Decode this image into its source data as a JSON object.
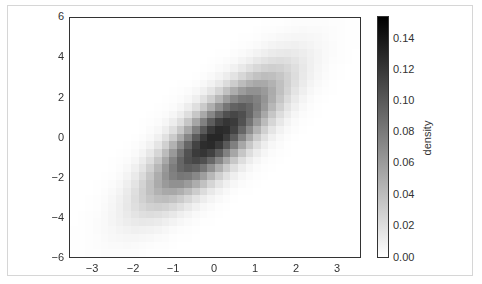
{
  "chart_data": {
    "type": "heatmap",
    "title": "",
    "xlabel": "",
    "ylabel": "",
    "xlim": [
      -3.5,
      3.5
    ],
    "ylim": [
      -6,
      6
    ],
    "x_ticks": [
      -3,
      -2,
      -1,
      0,
      1,
      2,
      3
    ],
    "y_ticks": [
      6,
      4,
      2,
      0,
      -2,
      -4,
      -6
    ],
    "x_tick_labels": [
      "−3",
      "−2",
      "−1",
      "0",
      "1",
      "2",
      "3"
    ],
    "y_tick_labels": [
      "6",
      "4",
      "2",
      "0",
      "−2",
      "−4",
      "−6"
    ],
    "grid": false,
    "colormap": "Greys",
    "distribution": {
      "kind": "bivariate-gaussian",
      "mean": [
        0,
        0
      ],
      "sigma_x": 1.0,
      "sigma_y": 2.0,
      "rho": 0.8,
      "bins_x": 38,
      "bins_y": 31
    },
    "colorbar": {
      "label": "density",
      "vmin": 0.0,
      "vmax": 0.155,
      "ticks": [
        0.14,
        0.12,
        0.1,
        0.08,
        0.06,
        0.04,
        0.02,
        0.0
      ],
      "tick_labels": [
        "0.14",
        "0.12",
        "0.10",
        "0.08",
        "0.06",
        "0.04",
        "0.02",
        "0.00"
      ]
    },
    "sampled_density": {
      "note": "approximate density at selected points read from shading",
      "points": [
        {
          "x": 0,
          "y": 0,
          "density": 0.13
        },
        {
          "x": -1,
          "y": -1.5,
          "density": 0.08
        },
        {
          "x": 1,
          "y": 1.5,
          "density": 0.08
        },
        {
          "x": -2,
          "y": -3,
          "density": 0.02
        },
        {
          "x": 2,
          "y": 3,
          "density": 0.02
        },
        {
          "x": -2,
          "y": 2,
          "density": 0.0
        },
        {
          "x": 2,
          "y": -2,
          "density": 0.0
        }
      ]
    }
  },
  "axes": {
    "y_labels": [
      {
        "text": "6",
        "top": 10
      },
      {
        "text": "4",
        "top": 50
      },
      {
        "text": "2",
        "top": 91
      },
      {
        "text": "0",
        "top": 131
      },
      {
        "text": "−2",
        "top": 171
      },
      {
        "text": "−4",
        "top": 211
      },
      {
        "text": "−6",
        "top": 251
      }
    ],
    "x_labels": [
      {
        "text": "−3",
        "left": 80
      },
      {
        "text": "−2",
        "left": 121
      },
      {
        "text": "−1",
        "left": 161
      },
      {
        "text": "0",
        "left": 202
      },
      {
        "text": "1",
        "left": 243
      },
      {
        "text": "2",
        "left": 284
      },
      {
        "text": "3",
        "left": 325
      }
    ]
  },
  "colorbar_labels": [
    {
      "text": "0.14",
      "top": 32
    },
    {
      "text": "0.12",
      "top": 63
    },
    {
      "text": "0.10",
      "top": 94
    },
    {
      "text": "0.08",
      "top": 125
    },
    {
      "text": "0.06",
      "top": 156
    },
    {
      "text": "0.04",
      "top": 188
    },
    {
      "text": "0.02",
      "top": 219
    },
    {
      "text": "0.00",
      "top": 251
    }
  ]
}
